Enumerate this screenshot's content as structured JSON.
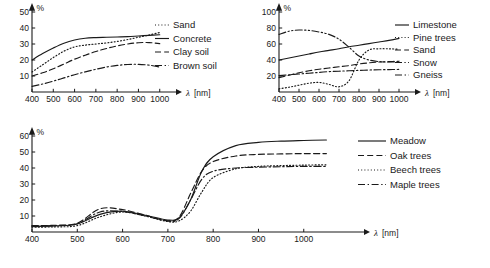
{
  "figure": {
    "axis_label": "λ",
    "axis_unit": "[nm]",
    "percent_symbol": "%"
  },
  "chart_data": [
    {
      "id": "soils",
      "type": "line",
      "title": "",
      "xlabel": "λ [nm]",
      "ylabel": "%",
      "xlim": [
        400,
        1020
      ],
      "ylim": [
        0,
        50
      ],
      "xticks": [
        400,
        500,
        600,
        700,
        800,
        900,
        1000
      ],
      "yticks": [
        10,
        20,
        30,
        40,
        50
      ],
      "grid": false,
      "legend_position": "right",
      "x": [
        400,
        450,
        500,
        550,
        600,
        650,
        700,
        750,
        800,
        850,
        900,
        950,
        1000
      ],
      "series": [
        {
          "name": "Concrete",
          "dash": "solid",
          "values": [
            20.0,
            24.0,
            27.5,
            30.5,
            32.5,
            33.6,
            34.0,
            34.2,
            34.4,
            34.6,
            35.0,
            35.4,
            35.8
          ]
        },
        {
          "name": "Sand",
          "dash": "dotted",
          "values": [
            12.5,
            17.0,
            21.5,
            25.5,
            28.2,
            29.3,
            30.0,
            30.7,
            31.6,
            32.8,
            34.2,
            35.6,
            37.2
          ]
        },
        {
          "name": "Clay soil",
          "dash": "dashed",
          "values": [
            10.0,
            12.0,
            14.5,
            17.5,
            20.5,
            23.0,
            25.3,
            27.2,
            28.8,
            30.0,
            30.8,
            30.9,
            30.2
          ]
        },
        {
          "name": "Brown soil",
          "dash": "dashdot",
          "values": [
            3.5,
            5.0,
            6.8,
            8.8,
            10.8,
            12.6,
            14.2,
            15.6,
            16.6,
            17.2,
            17.3,
            16.8,
            15.6
          ]
        }
      ],
      "legend": [
        "Sand",
        "Concrete",
        "Clay soil",
        "Brown soil"
      ]
    },
    {
      "id": "materials",
      "type": "line",
      "title": "",
      "xlabel": "λ [nm]",
      "ylabel": "%",
      "xlim": [
        400,
        1020
      ],
      "ylim": [
        0,
        100
      ],
      "xticks": [
        400,
        500,
        600,
        700,
        800,
        900,
        1000
      ],
      "yticks": [
        20,
        40,
        60,
        80,
        100
      ],
      "grid": false,
      "legend_position": "right",
      "x": [
        400,
        450,
        500,
        550,
        600,
        650,
        700,
        750,
        800,
        850,
        900,
        950,
        1000
      ],
      "series": [
        {
          "name": "Limestone",
          "dash": "solid",
          "values": [
            40.0,
            42.5,
            45.0,
            47.5,
            50.0,
            52.0,
            54.0,
            56.5,
            58.5,
            60.5,
            62.5,
            64.5,
            67.0
          ]
        },
        {
          "name": "Pine trees",
          "dash": "dotted",
          "values": [
            4.0,
            6.0,
            8.5,
            11.0,
            12.0,
            9.5,
            6.5,
            14.0,
            40.0,
            52.5,
            54.0,
            54.0,
            53.5
          ]
        },
        {
          "name": "Sand",
          "dash": "dashed",
          "values": [
            18.0,
            21.0,
            24.0,
            26.5,
            28.5,
            30.0,
            31.5,
            33.0,
            35.0,
            36.5,
            37.5,
            38.0,
            38.5
          ]
        },
        {
          "name": "Snow",
          "dash": "dashdotdot",
          "values": [
            72.0,
            76.0,
            77.5,
            77.0,
            75.0,
            72.0,
            66.0,
            56.0,
            45.0,
            40.0,
            38.0,
            37.5,
            38.0
          ]
        },
        {
          "name": "Gneiss",
          "dash": "dashdot",
          "values": [
            20.5,
            21.5,
            22.5,
            23.5,
            24.5,
            25.5,
            26.0,
            26.5,
            27.0,
            27.5,
            27.8,
            28.0,
            28.2
          ]
        }
      ],
      "legend": [
        "Limestone",
        "Pine trees",
        "Sand",
        "Snow",
        "Gneiss"
      ]
    },
    {
      "id": "vegetation",
      "type": "line",
      "title": "",
      "xlabel": "λ [nm]",
      "ylabel": "%",
      "xlim": [
        400,
        1080
      ],
      "ylim": [
        0,
        60
      ],
      "xticks": [
        400,
        500,
        600,
        700,
        800,
        900,
        1000
      ],
      "yticks": [
        10,
        20,
        30,
        40,
        50,
        60
      ],
      "grid": false,
      "legend_position": "right",
      "x": [
        400,
        450,
        500,
        550,
        600,
        650,
        700,
        725,
        750,
        775,
        800,
        850,
        900,
        950,
        1000,
        1050
      ],
      "series": [
        {
          "name": "Meadow",
          "dash": "solid",
          "values": [
            3.5,
            3.8,
            5.0,
            11.0,
            13.0,
            10.5,
            7.5,
            9.0,
            20.0,
            38.0,
            47.0,
            54.0,
            56.0,
            56.8,
            57.2,
            57.5
          ]
        },
        {
          "name": "Oak trees",
          "dash": "dashed",
          "values": [
            4.0,
            4.2,
            5.5,
            14.5,
            14.0,
            10.5,
            7.0,
            9.5,
            24.0,
            38.0,
            44.0,
            47.5,
            48.5,
            48.8,
            49.0,
            49.0
          ]
        },
        {
          "name": "Beech trees",
          "dash": "dotted",
          "values": [
            3.0,
            3.2,
            4.0,
            9.5,
            12.5,
            10.0,
            6.5,
            7.0,
            13.0,
            25.0,
            34.0,
            39.5,
            41.0,
            41.5,
            41.8,
            42.0
          ]
        },
        {
          "name": "Maple trees",
          "dash": "dashdot",
          "values": [
            3.8,
            4.0,
            5.2,
            12.5,
            12.8,
            10.0,
            6.8,
            8.5,
            20.0,
            33.0,
            38.0,
            40.0,
            40.5,
            40.8,
            41.0,
            41.0
          ]
        }
      ],
      "legend": [
        "Meadow",
        "Oak trees",
        "Beech trees",
        "Maple trees"
      ]
    }
  ]
}
